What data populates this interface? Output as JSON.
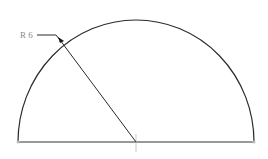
{
  "diagram": {
    "title": "",
    "shape": "semicircle",
    "dimension": {
      "label": "R 6",
      "type": "radius"
    },
    "colors": {
      "line": "#2a2a2a",
      "text": "#8a8a8a",
      "background": "#ffffff"
    }
  }
}
